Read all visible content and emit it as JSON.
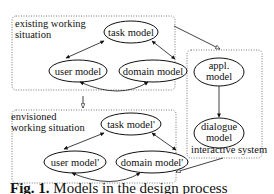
{
  "diagram": {
    "groups": [
      {
        "id": "existing",
        "label_line1": "existing working",
        "label_line2": "situation"
      },
      {
        "id": "envisioned",
        "label_line1": "envisioned",
        "label_line2": "working situation"
      },
      {
        "id": "interactive",
        "label": "interactive system"
      }
    ],
    "nodes": {
      "task_model": "task model",
      "user_model": "user model",
      "domain_model": "domain model",
      "task_model_prime": "task model'",
      "user_model_prime": "user model'",
      "domain_model_prime": "domain model'",
      "appl_model_line1": "appl.",
      "appl_model_line2": "model",
      "dialogue_model_line1": "dialogue",
      "dialogue_model_line2": "model"
    },
    "edges": [
      {
        "from": "task model",
        "to": "user model",
        "type": "bidirectional"
      },
      {
        "from": "task model",
        "to": "domain model",
        "type": "bidirectional"
      },
      {
        "from": "user model",
        "to": "domain model",
        "type": "bidirectional"
      },
      {
        "from": "task model'",
        "to": "user model'",
        "type": "bidirectional"
      },
      {
        "from": "task model'",
        "to": "domain model'",
        "type": "bidirectional"
      },
      {
        "from": "user model'",
        "to": "domain model'",
        "type": "bidirectional"
      },
      {
        "from": "appl. model",
        "to": "dialogue model",
        "type": "directed"
      },
      {
        "from": "existing working situation",
        "to": "envisioned working situation",
        "type": "open-arrow"
      },
      {
        "from": "existing working situation",
        "to": "interactive system",
        "type": "open-arrow"
      },
      {
        "from": "interactive system",
        "to": "envisioned working situation",
        "type": "open-arrow"
      }
    ]
  },
  "caption": {
    "prefix": "Fig. 1.",
    "text": "Models in the design process"
  }
}
